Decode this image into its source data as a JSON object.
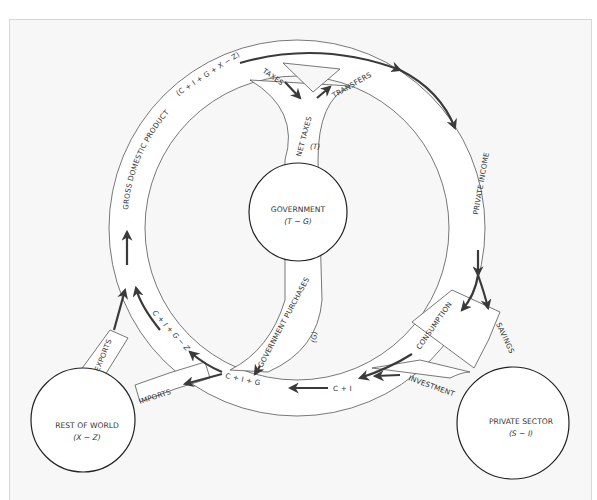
{
  "diagram": {
    "type": "circular-flow",
    "nodes": {
      "government": {
        "label": "GOVERNMENT",
        "formula": "(T − G)"
      },
      "private_sector": {
        "label": "PRIVATE SECTOR",
        "formula": "(S − I)"
      },
      "rest_of_world": {
        "label": "REST OF WORLD",
        "formula": "(X − Z)"
      }
    },
    "flows": {
      "gdp": "GROSS DOMESTIC PRODUCT",
      "gdp_formula": "(C + I + G + X − Z)",
      "taxes": "TAXES",
      "transfers": "TRANSFERS",
      "net_taxes": "NET TAXES",
      "net_taxes_symbol": "(T)",
      "private_income": "PRIVATE INCOME",
      "consumption": "CONSUMPTION",
      "savings": "SAVINGS",
      "investment": "INVESTMENT",
      "c_plus_i": "C + I",
      "government_purchases": "GOVERNMENT PURCHASES",
      "government_purchases_symbol": "(G)",
      "c_plus_i_plus_g": "C + I + G",
      "imports": "IMPORTS",
      "exports": "EXPORTS",
      "c_i_g_minus_z": "C + I + G − Z"
    }
  }
}
